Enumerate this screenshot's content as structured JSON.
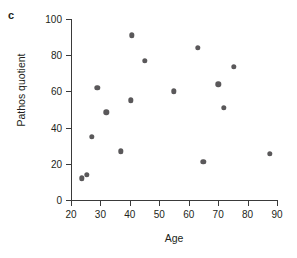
{
  "panel": {
    "letter": "c"
  },
  "chart_data": {
    "type": "scatter",
    "title": "",
    "xlabel": "Age",
    "ylabel": "Pathos quotient",
    "xlim": [
      20,
      90
    ],
    "ylim": [
      0,
      100
    ],
    "xticks": [
      20,
      30,
      40,
      50,
      60,
      70,
      80,
      90
    ],
    "yticks": [
      0,
      20,
      40,
      60,
      80,
      100
    ],
    "grid": false,
    "legend": null,
    "marker_color": "#5a585a",
    "axis_color": "#3a3a3a",
    "series": [
      {
        "name": "participants",
        "points": [
          {
            "x": 23.7,
            "y": 12
          },
          {
            "x": 25.4,
            "y": 14
          },
          {
            "x": 27.0,
            "y": 35
          },
          {
            "x": 29.0,
            "y": 62
          },
          {
            "x": 32.0,
            "y": 48.5
          },
          {
            "x": 37.0,
            "y": 27
          },
          {
            "x": 40.7,
            "y": 91
          },
          {
            "x": 40.3,
            "y": 55
          },
          {
            "x": 45.0,
            "y": 77
          },
          {
            "x": 55.0,
            "y": 60
          },
          {
            "x": 63.0,
            "y": 84
          },
          {
            "x": 65.0,
            "y": 21
          },
          {
            "x": 70.0,
            "y": 64
          },
          {
            "x": 72.0,
            "y": 51
          },
          {
            "x": 75.3,
            "y": 73.5
          },
          {
            "x": 87.6,
            "y": 25.5
          }
        ]
      }
    ]
  }
}
